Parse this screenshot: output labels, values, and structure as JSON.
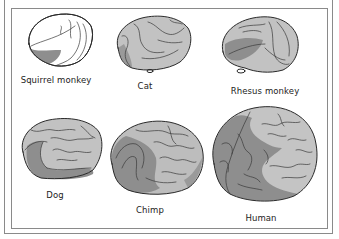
{
  "figure": {
    "colors": {
      "background": "#ffffff",
      "frame": "#8a8a8a",
      "brain_base": "#c2c2c2",
      "brain_highlight": "#b4b4b4",
      "brain_shaded_region": "#8e8e8e",
      "outline": "#2a2a2a",
      "label_text": "#222222"
    },
    "brains": [
      {
        "id": "squirrel-monkey",
        "label": "Squirrel monkey",
        "row": 1,
        "col": 1
      },
      {
        "id": "cat",
        "label": "Cat",
        "row": 1,
        "col": 2
      },
      {
        "id": "rhesus-monkey",
        "label": "Rhesus monkey",
        "row": 1,
        "col": 3
      },
      {
        "id": "dog",
        "label": "Dog",
        "row": 2,
        "col": 1
      },
      {
        "id": "chimp",
        "label": "Chimp",
        "row": 2,
        "col": 2
      },
      {
        "id": "human",
        "label": "Human",
        "row": 2,
        "col": 3
      }
    ]
  }
}
